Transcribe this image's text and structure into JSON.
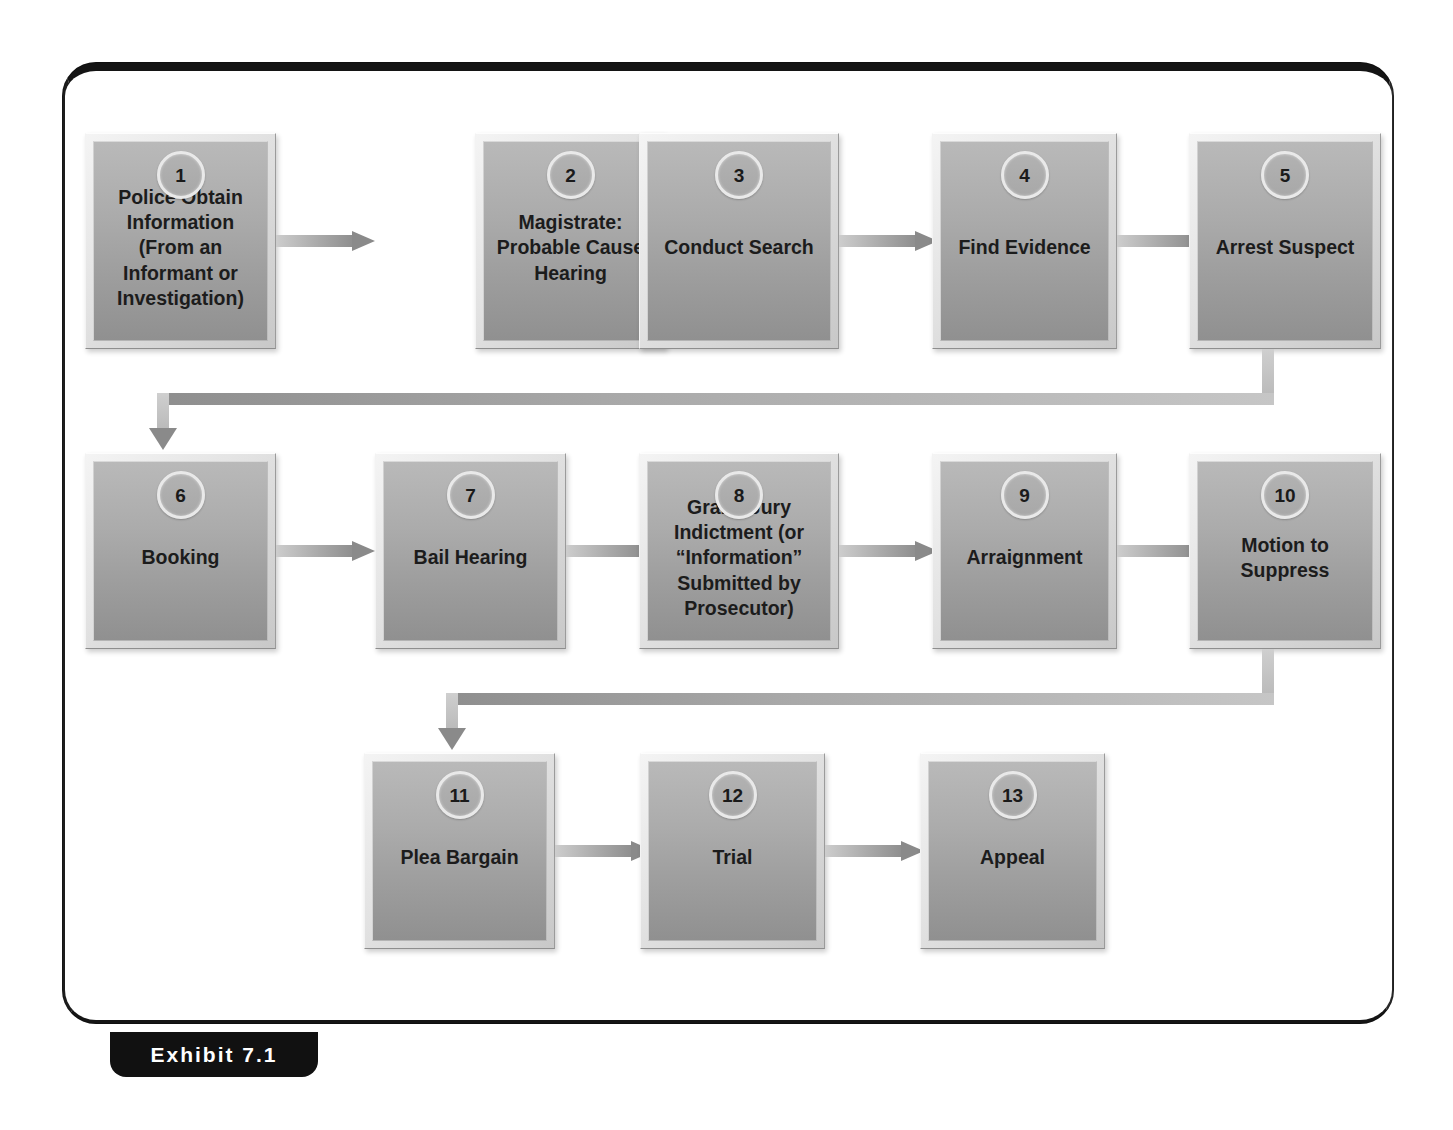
{
  "exhibit": {
    "label": "Exhibit 7.1"
  },
  "diagram": {
    "type": "flowchart",
    "colors": {
      "frame": "#111111",
      "box_fill_top": "#b9b9b9",
      "box_fill_bottom": "#909090",
      "bevel_light": "#f4f4f4",
      "bevel_dark": "#8e8e8e",
      "arrow": "#8a8a8a",
      "text": "#1c1c1c",
      "badge_ring": "#e9e9e9"
    },
    "rows": [
      {
        "row_index": 1,
        "nodes": [
          {
            "number": "1",
            "label": "Police Obtain\nInformation\n(From an\nInformant or\nInvestigation)"
          },
          {
            "number": "2",
            "label": "Magistrate:\nProbable Cause\nHearing"
          },
          {
            "number": "3",
            "label": "Conduct Search"
          },
          {
            "number": "4",
            "label": "Find Evidence"
          },
          {
            "number": "5",
            "label": "Arrest Suspect"
          }
        ]
      },
      {
        "row_index": 2,
        "nodes": [
          {
            "number": "6",
            "label": "Booking"
          },
          {
            "number": "7",
            "label": "Bail Hearing"
          },
          {
            "number": "8",
            "label": "Grand Jury\nIndictment (or\n“Information”\nSubmitted by\nProsecutor)"
          },
          {
            "number": "9",
            "label": "Arraignment"
          },
          {
            "number": "10",
            "label": "Motion to\nSuppress"
          }
        ]
      },
      {
        "row_index": 3,
        "nodes": [
          {
            "number": "11",
            "label": "Plea Bargain"
          },
          {
            "number": "12",
            "label": "Trial"
          },
          {
            "number": "13",
            "label": "Appeal"
          }
        ]
      }
    ],
    "connections": [
      {
        "from": "1",
        "to": "2",
        "kind": "arrow-right"
      },
      {
        "from": "2",
        "to": "3",
        "kind": "arrow-right"
      },
      {
        "from": "3",
        "to": "4",
        "kind": "arrow-right"
      },
      {
        "from": "4",
        "to": "5",
        "kind": "arrow-right"
      },
      {
        "from": "5",
        "to": "6",
        "kind": "elbow-down-left-down"
      },
      {
        "from": "6",
        "to": "7",
        "kind": "arrow-right"
      },
      {
        "from": "7",
        "to": "8",
        "kind": "arrow-right"
      },
      {
        "from": "8",
        "to": "9",
        "kind": "arrow-right"
      },
      {
        "from": "9",
        "to": "10",
        "kind": "arrow-right"
      },
      {
        "from": "10",
        "to": "11",
        "kind": "elbow-down-left-down"
      },
      {
        "from": "11",
        "to": "12",
        "kind": "arrow-right"
      },
      {
        "from": "12",
        "to": "13",
        "kind": "arrow-right"
      }
    ]
  }
}
